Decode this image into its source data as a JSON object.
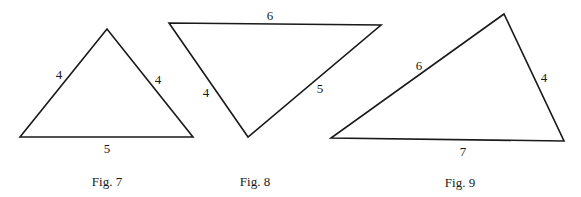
{
  "figures": [
    {
      "caption": "Fig. 7",
      "vertices": [
        [
          107,
          29
        ],
        [
          20,
          137
        ],
        [
          193,
          137
        ]
      ],
      "side_labels": [
        {
          "text": "4",
          "x": 59,
          "y": 79
        },
        {
          "text": "4",
          "x": 158,
          "y": 84
        },
        {
          "text": "5",
          "x": 107,
          "y": 153
        }
      ],
      "caption_pos": {
        "x": 107,
        "y": 186
      }
    },
    {
      "caption": "Fig. 8",
      "vertices": [
        [
          169,
          23
        ],
        [
          381,
          25
        ],
        [
          248,
          137
        ]
      ],
      "side_labels": [
        {
          "text": "6",
          "x": 270,
          "y": 20
        },
        {
          "text": "4",
          "x": 206,
          "y": 97
        },
        {
          "text": "5",
          "x": 320,
          "y": 93
        }
      ],
      "caption_pos": {
        "x": 255,
        "y": 186
      }
    },
    {
      "caption": "Fig. 9",
      "vertices": [
        [
          504,
          14
        ],
        [
          331,
          138
        ],
        [
          564,
          141
        ]
      ],
      "side_labels": [
        {
          "text": "6",
          "x": 419,
          "y": 70
        },
        {
          "text": "4",
          "x": 544,
          "y": 82
        },
        {
          "text": "7",
          "x": 463,
          "y": 156
        }
      ],
      "caption_pos": {
        "x": 460,
        "y": 187
      }
    }
  ],
  "colors": {
    "line": "#1a1a1a",
    "background": "#ffffff"
  }
}
